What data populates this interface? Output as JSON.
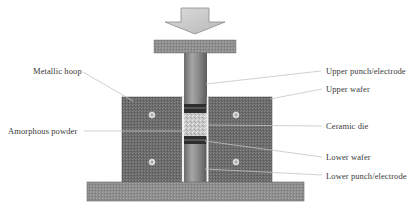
{
  "labels": {
    "left": [
      {
        "id": "metallic-hoop",
        "text": "Metallic hoop"
      },
      {
        "id": "amorphous-powder",
        "text": "Amorphous powder"
      }
    ],
    "right": [
      {
        "id": "upper-punch-electrode",
        "text": "Upper punch/electrode"
      },
      {
        "id": "upper-wafer",
        "text": "Upper wafer"
      },
      {
        "id": "ceramic-die",
        "text": "Ceramic die"
      },
      {
        "id": "lower-wafer",
        "text": "Lower wafer"
      },
      {
        "id": "lower-punch-electrode",
        "text": "Lower punch/electrode"
      }
    ]
  },
  "components": {
    "load-arrow": {
      "direction": "down",
      "color": "#c8c8c8"
    },
    "top-plate": {
      "color": "#8a8a8a"
    },
    "punch": {
      "color": "#8c8c8c"
    },
    "die-block": {
      "color": "#6e6e6e"
    },
    "base-plate": {
      "color": "#8c8c8c"
    },
    "wafer": {
      "color": "#2e2e2e"
    },
    "powder": {
      "color": "#c9c9c9"
    },
    "leader-line": {
      "color": "#c4c4c4"
    }
  }
}
